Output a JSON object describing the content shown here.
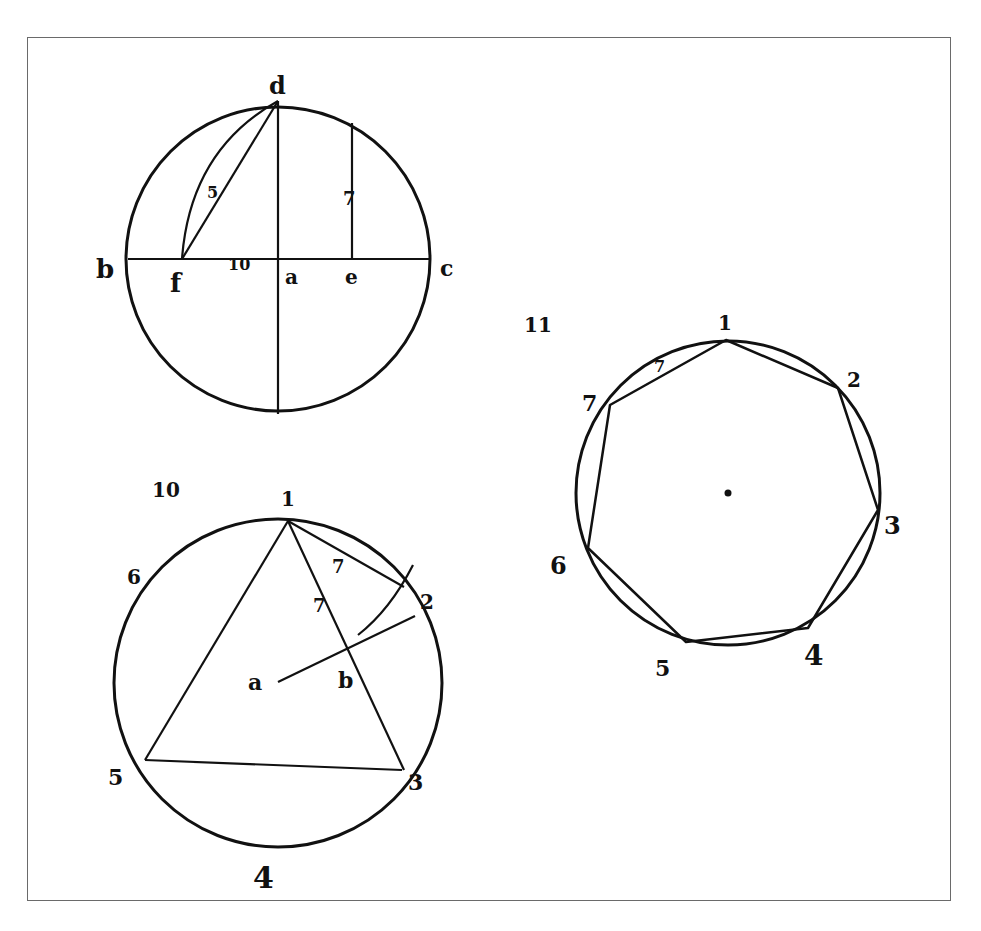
{
  "figures": [
    {
      "id": "fig-top-left",
      "circle": {
        "cx": 278,
        "cy": 259,
        "r": 152
      },
      "segments": [
        {
          "x1": 128,
          "y1": 259,
          "x2": 430,
          "y2": 259
        },
        {
          "x1": 278,
          "y1": 101,
          "x2": 278,
          "y2": 414
        },
        {
          "x1": 352,
          "y1": 123,
          "x2": 352,
          "y2": 259
        },
        {
          "x1": 278,
          "y1": 101,
          "x2": 182,
          "y2": 259
        }
      ],
      "arcs": [
        {
          "d": "M278,101 Q190,150 182,259"
        }
      ],
      "labels": [
        {
          "text": "d",
          "x": 269,
          "y": 94,
          "size": 24
        },
        {
          "text": "b",
          "x": 96,
          "y": 278,
          "size": 26
        },
        {
          "text": "c",
          "x": 440,
          "y": 276,
          "size": 22
        },
        {
          "text": "f",
          "x": 170,
          "y": 292,
          "size": 26
        },
        {
          "text": "10",
          "x": 228,
          "y": 270,
          "size": 16
        },
        {
          "text": "a",
          "x": 285,
          "y": 284,
          "size": 20
        },
        {
          "text": "e",
          "x": 345,
          "y": 284,
          "size": 20
        },
        {
          "text": "5",
          "x": 207,
          "y": 198,
          "size": 16
        },
        {
          "text": "7",
          "x": 343,
          "y": 205,
          "size": 18
        }
      ]
    },
    {
      "id": "fig-10",
      "circle": {
        "cx": 278,
        "cy": 683,
        "r": 164
      },
      "segments": [
        {
          "x1": 288,
          "y1": 521,
          "x2": 145,
          "y2": 760
        },
        {
          "x1": 145,
          "y1": 760,
          "x2": 402,
          "y2": 770
        },
        {
          "x1": 288,
          "y1": 521,
          "x2": 404,
          "y2": 770
        },
        {
          "x1": 288,
          "y1": 521,
          "x2": 404,
          "y2": 587
        },
        {
          "x1": 278,
          "y1": 682,
          "x2": 415,
          "y2": 616
        }
      ],
      "arcs": [
        {
          "d": "M358,635 Q390,610 413,565"
        }
      ],
      "labels": [
        {
          "text": "10",
          "x": 152,
          "y": 497,
          "size": 20
        },
        {
          "text": "1",
          "x": 281,
          "y": 506,
          "size": 20
        },
        {
          "text": "6",
          "x": 127,
          "y": 584,
          "size": 20
        },
        {
          "text": "2",
          "x": 420,
          "y": 609,
          "size": 20
        },
        {
          "text": "a",
          "x": 248,
          "y": 690,
          "size": 22
        },
        {
          "text": "b",
          "x": 338,
          "y": 688,
          "size": 22
        },
        {
          "text": "5",
          "x": 108,
          "y": 785,
          "size": 22
        },
        {
          "text": "3",
          "x": 408,
          "y": 790,
          "size": 22
        },
        {
          "text": "4",
          "x": 253,
          "y": 888,
          "size": 30
        },
        {
          "text": "7",
          "x": 332,
          "y": 573,
          "size": 18
        },
        {
          "text": "7",
          "x": 313,
          "y": 612,
          "size": 18
        }
      ]
    },
    {
      "id": "fig-11",
      "circle": {
        "cx": 728,
        "cy": 493,
        "r": 152
      },
      "center_dot": {
        "x": 728,
        "y": 493
      },
      "polygon": [
        [
          726,
          340
        ],
        [
          838,
          388
        ],
        [
          878,
          510
        ],
        [
          808,
          628
        ],
        [
          686,
          642
        ],
        [
          588,
          548
        ],
        [
          610,
          405
        ]
      ],
      "labels": [
        {
          "text": "11",
          "x": 524,
          "y": 332,
          "size": 20
        },
        {
          "text": "1",
          "x": 718,
          "y": 330,
          "size": 20
        },
        {
          "text": "2",
          "x": 847,
          "y": 387,
          "size": 20
        },
        {
          "text": "3",
          "x": 884,
          "y": 534,
          "size": 24
        },
        {
          "text": "4",
          "x": 804,
          "y": 665,
          "size": 28
        },
        {
          "text": "5",
          "x": 655,
          "y": 676,
          "size": 22
        },
        {
          "text": "6",
          "x": 550,
          "y": 574,
          "size": 24
        },
        {
          "text": "7",
          "x": 582,
          "y": 411,
          "size": 22
        },
        {
          "text": "7",
          "x": 654,
          "y": 372,
          "size": 16
        }
      ]
    }
  ]
}
